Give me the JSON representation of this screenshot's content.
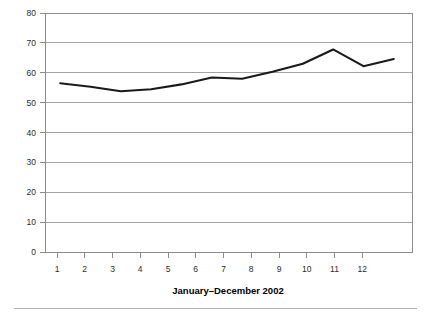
{
  "chart_data": {
    "type": "line",
    "title": "",
    "subtitle": "",
    "xlabel": "January–December 2002",
    "ylabel": "",
    "categories": [
      "1",
      "2",
      "3",
      "4",
      "5",
      "6",
      "7",
      "8",
      "9",
      "10",
      "11",
      "12"
    ],
    "x": [
      1,
      2,
      3,
      4,
      5,
      6,
      7,
      8,
      9,
      10,
      11,
      12
    ],
    "values": [
      56.5,
      55.3,
      53.8,
      54.5,
      56.1,
      58.4,
      58.0,
      60.3,
      63.0,
      67.8,
      62.2,
      64.6
    ],
    "series": [
      {
        "name": "",
        "values": [
          56.5,
          55.3,
          53.8,
          54.5,
          56.1,
          58.4,
          58.0,
          60.3,
          63.0,
          67.8,
          62.2,
          64.6
        ],
        "color": "#1a1a1a"
      }
    ],
    "xlim": [
      0.5,
      12.6
    ],
    "ylim": [
      0,
      80
    ],
    "yticks": [
      0,
      10,
      20,
      30,
      40,
      50,
      60,
      70,
      80
    ],
    "ytick_labels": [
      "0",
      "10",
      "20",
      "30",
      "40",
      "50",
      "60",
      "70",
      "80"
    ],
    "xtick_labels": [
      "1",
      "2",
      "3",
      "4",
      "5",
      "6",
      "7",
      "8",
      "9",
      "10",
      "11",
      "12"
    ],
    "grid": {
      "horizontal": true,
      "vertical": false,
      "color": "#9a9a9a"
    },
    "legend": {
      "visible": false,
      "position": "none",
      "entries": []
    },
    "annotations": [],
    "frame": {
      "top": true,
      "right": true,
      "bottom": true,
      "left": true,
      "color": "#8c8c8c"
    },
    "footer_rule": true
  }
}
